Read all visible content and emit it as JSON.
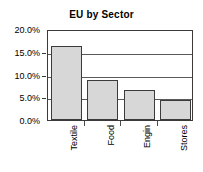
{
  "chart_data": {
    "type": "bar",
    "title": "EU by Sector",
    "xlabel": "",
    "ylabel": "",
    "categories": [
      "Textile",
      "Food",
      "Engin",
      "Stores"
    ],
    "values": [
      16.3,
      8.7,
      6.6,
      4.4
    ],
    "value_labels": [
      "16.3%",
      "8.7%",
      "6.6%",
      "4.4%"
    ],
    "ylim": [
      0,
      20
    ],
    "ytick_values": [
      0,
      5,
      10,
      15,
      20
    ],
    "ytick_labels": [
      "0.0%",
      "5.0%",
      "10.0%",
      "15.0%",
      "20.0%"
    ],
    "grid": true,
    "legend": false,
    "legend_position": "none",
    "series": [
      {
        "name": "EU by Sector",
        "values": [
          16.3,
          8.7,
          6.6,
          4.4
        ],
        "bar_fill": "#d7d7d7",
        "bar_border": "#3b3b3b"
      }
    ]
  },
  "colors": {
    "background": "#ffffff",
    "text": "#000000",
    "axis": "#3a3a3a",
    "gridline": "#5a5a5a",
    "bar_fill": "#d7d7d7",
    "bar_border": "#3b3b3b"
  }
}
